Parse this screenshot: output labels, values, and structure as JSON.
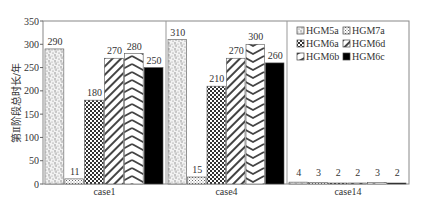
{
  "chart_data": {
    "type": "bar",
    "title": "",
    "xlabel": "",
    "ylabel": "第Ⅱ阶段总时长/年",
    "ylim": [
      0,
      350
    ],
    "yticks": [
      0,
      50,
      100,
      150,
      200,
      250,
      300,
      350
    ],
    "grid": false,
    "categories": [
      "case1",
      "case4",
      "case14"
    ],
    "series": [
      {
        "name": "HGM5a",
        "pattern": "stipple",
        "values": [
          290,
          310,
          4
        ]
      },
      {
        "name": "HGM7a",
        "pattern": "fine-dots",
        "values": [
          11,
          15,
          3
        ]
      },
      {
        "name": "HGM6a",
        "pattern": "checker",
        "values": [
          180,
          210,
          2
        ]
      },
      {
        "name": "HGM6d",
        "pattern": "diagonal-hatch",
        "values": [
          270,
          270,
          2
        ]
      },
      {
        "name": "HGM6b",
        "pattern": "chevron",
        "values": [
          280,
          300,
          3
        ]
      },
      {
        "name": "HGM6c",
        "pattern": "solid-black",
        "values": [
          250,
          260,
          2
        ]
      }
    ],
    "legend": {
      "placement": "top-right",
      "columns": 2,
      "order": [
        "HGM5a",
        "HGM7a",
        "HGM6a",
        "HGM6d",
        "HGM6b",
        "HGM6c"
      ]
    },
    "data_labels": true,
    "group_separators": true
  }
}
